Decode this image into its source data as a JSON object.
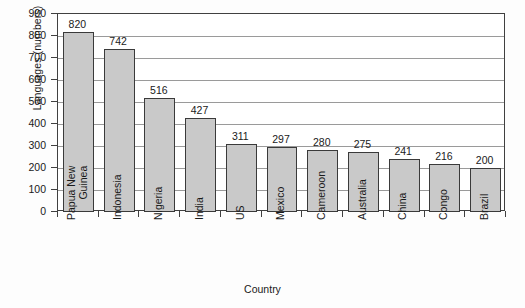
{
  "chart_data": {
    "type": "bar",
    "title": "",
    "xlabel": "Country",
    "ylabel": "Languages (numbers)",
    "categories": [
      "Papua New Guinea",
      "Indonesia",
      "Nigeria",
      "India",
      "US",
      "Mexico",
      "Cameroon",
      "Australia",
      "China",
      "Congo",
      "Brazil"
    ],
    "category_lines": [
      [
        "Papua New",
        "Guinea"
      ],
      [
        "Indonesia"
      ],
      [
        "Nigeria"
      ],
      [
        "India"
      ],
      [
        "US"
      ],
      [
        "Mexico"
      ],
      [
        "Cameroon"
      ],
      [
        "Australia"
      ],
      [
        "China"
      ],
      [
        "Congo"
      ],
      [
        "Brazil"
      ]
    ],
    "values": [
      820,
      742,
      516,
      427,
      311,
      297,
      280,
      275,
      241,
      216,
      200
    ],
    "ylim": [
      0,
      900
    ],
    "yticks": [
      0,
      100,
      200,
      300,
      400,
      500,
      600,
      700,
      800,
      900
    ],
    "ytick_labels": [
      "0",
      "100",
      "200",
      "300",
      "400",
      "500",
      "600",
      "700",
      "800",
      "900"
    ],
    "grid": true,
    "grid_axis": "y",
    "legend": false,
    "data_labels": true,
    "colors": {
      "bar_fill": "#c9c9c9",
      "bar_edge": "#3a3a3a",
      "grid": "#9a9a9a",
      "frame": "#404040",
      "text": "#1a1a1a",
      "background": "#ffffff"
    }
  }
}
